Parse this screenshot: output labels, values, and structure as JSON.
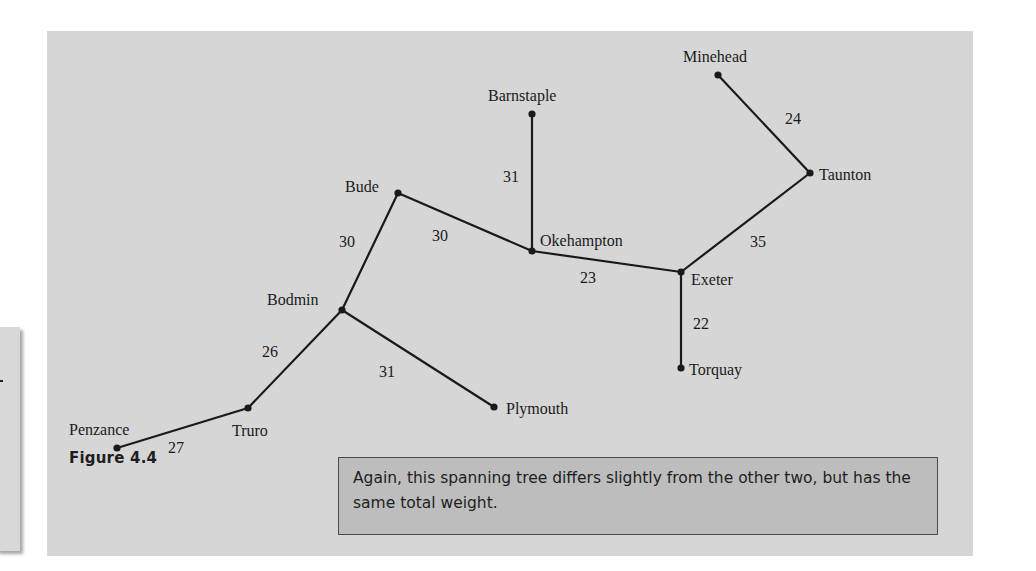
{
  "figure": {
    "caption": "Figure 4.4",
    "note": "Again, this spanning tree differs slightly from the other two, but has the same total weight.",
    "colors": {
      "panel_background": "#d6d6d6",
      "note_background": "#bdbdbd",
      "edge_color": "#1a1a1a"
    }
  },
  "graph": {
    "type": "spanning-tree",
    "nodes": [
      {
        "id": "minehead",
        "label": "Minehead",
        "x": 718,
        "y": 75,
        "lx": 683,
        "ly": 62,
        "anchor": "start"
      },
      {
        "id": "barnstaple",
        "label": "Barnstaple",
        "x": 532,
        "y": 114,
        "lx": 488,
        "ly": 101,
        "anchor": "start"
      },
      {
        "id": "taunton",
        "label": "Taunton",
        "x": 810,
        "y": 173,
        "lx": 819,
        "ly": 180,
        "anchor": "start"
      },
      {
        "id": "bude",
        "label": "Bude",
        "x": 398,
        "y": 193,
        "lx": 345,
        "ly": 192,
        "anchor": "start"
      },
      {
        "id": "okehampton",
        "label": "Okehampton",
        "x": 532,
        "y": 251,
        "lx": 540,
        "ly": 246,
        "anchor": "start"
      },
      {
        "id": "exeter",
        "label": "Exeter",
        "x": 681,
        "y": 272,
        "lx": 691,
        "ly": 285,
        "anchor": "start"
      },
      {
        "id": "bodmin",
        "label": "Bodmin",
        "x": 342,
        "y": 310,
        "lx": 267,
        "ly": 305,
        "anchor": "start"
      },
      {
        "id": "torquay",
        "label": "Torquay",
        "x": 681,
        "y": 368,
        "lx": 689,
        "ly": 375,
        "anchor": "start"
      },
      {
        "id": "plymouth",
        "label": "Plymouth",
        "x": 494,
        "y": 407,
        "lx": 506,
        "ly": 414,
        "anchor": "start"
      },
      {
        "id": "truro",
        "label": "Truro",
        "x": 248,
        "y": 408,
        "lx": 232,
        "ly": 436,
        "anchor": "start"
      },
      {
        "id": "penzance",
        "label": "Penzance",
        "x": 117,
        "y": 448,
        "lx": 69,
        "ly": 435,
        "anchor": "start"
      }
    ],
    "edges": [
      {
        "from": "minehead",
        "to": "taunton",
        "weight": "24",
        "lx": 785,
        "ly": 124
      },
      {
        "from": "taunton",
        "to": "exeter",
        "weight": "35",
        "lx": 750,
        "ly": 247
      },
      {
        "from": "barnstaple",
        "to": "okehampton",
        "weight": "31",
        "lx": 503,
        "ly": 182
      },
      {
        "from": "bude",
        "to": "okehampton",
        "weight": "30",
        "lx": 432,
        "ly": 241
      },
      {
        "from": "okehampton",
        "to": "exeter",
        "weight": "23",
        "lx": 580,
        "ly": 283
      },
      {
        "from": "exeter",
        "to": "torquay",
        "weight": "22",
        "lx": 693,
        "ly": 329
      },
      {
        "from": "bude",
        "to": "bodmin",
        "weight": "30",
        "lx": 339,
        "ly": 247
      },
      {
        "from": "bodmin",
        "to": "truro",
        "weight": "26",
        "lx": 262,
        "ly": 357
      },
      {
        "from": "bodmin",
        "to": "plymouth",
        "weight": "31",
        "lx": 379,
        "ly": 377
      },
      {
        "from": "truro",
        "to": "penzance",
        "weight": "27",
        "lx": 168,
        "ly": 453
      }
    ]
  }
}
